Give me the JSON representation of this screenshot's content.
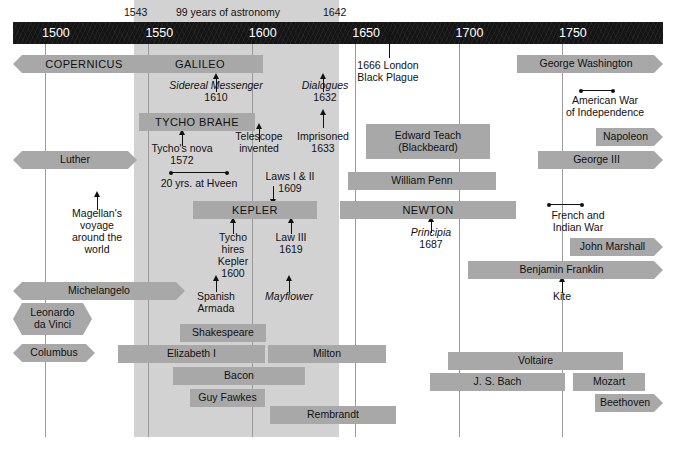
{
  "header": {
    "start_year": "1543",
    "title": "99 years of astronomy",
    "end_year": "1642"
  },
  "axis": {
    "ticks": [
      "1500",
      "1550",
      "1600",
      "1650",
      "1700",
      "1750"
    ],
    "tick_years": [
      1500,
      1550,
      1600,
      1650,
      1700,
      1750
    ],
    "range": [
      1490,
      1805
    ],
    "color": "#141414",
    "label_color": "#ffffff"
  },
  "band": {
    "from_year": 1543,
    "to_year": 1642,
    "color": "#d2d2d2"
  },
  "bar_color": "#a8a8a8",
  "bars": [
    {
      "label": "COPERNICUS",
      "x": 13,
      "y": 55,
      "w": 142,
      "h": 18,
      "style": "tail-lr",
      "caps": true
    },
    {
      "label": "GALILEO",
      "x": 137,
      "y": 55,
      "w": 126,
      "h": 18,
      "style": "plain",
      "caps": true
    },
    {
      "label": "George Washington",
      "x": 517,
      "y": 55,
      "w": 146,
      "h": 18,
      "style": "tail-r",
      "caps": false
    },
    {
      "label": "TYCHO BRAHE",
      "x": 139,
      "y": 113,
      "w": 116,
      "h": 18,
      "style": "plain",
      "caps": true
    },
    {
      "label": "Edward Teach\n(Blackbeard)",
      "x": 366,
      "y": 124,
      "w": 124,
      "h": 35,
      "style": "plain",
      "caps": false
    },
    {
      "label": "Napoleon",
      "x": 596,
      "y": 128,
      "w": 67,
      "h": 18,
      "style": "tail-r",
      "caps": false
    },
    {
      "label": "Luther",
      "x": 13,
      "y": 151,
      "w": 124,
      "h": 18,
      "style": "tail-lr",
      "caps": false
    },
    {
      "label": "George III",
      "x": 538,
      "y": 151,
      "w": 125,
      "h": 18,
      "style": "tail-r",
      "caps": false
    },
    {
      "label": "William Penn",
      "x": 348,
      "y": 172,
      "w": 148,
      "h": 18,
      "style": "plain",
      "caps": false
    },
    {
      "label": "KEPLER",
      "x": 193,
      "y": 201,
      "w": 124,
      "h": 18,
      "style": "plain",
      "caps": true
    },
    {
      "label": "NEWTON",
      "x": 340,
      "y": 201,
      "w": 176,
      "h": 18,
      "style": "plain",
      "caps": true
    },
    {
      "label": "John Marshall",
      "x": 570,
      "y": 238,
      "w": 93,
      "h": 18,
      "style": "tail-r",
      "caps": false
    },
    {
      "label": "Benjamin Franklin",
      "x": 468,
      "y": 261,
      "w": 195,
      "h": 18,
      "style": "tail-r",
      "caps": false
    },
    {
      "label": "Michelangelo",
      "x": 13,
      "y": 282,
      "w": 172,
      "h": 18,
      "style": "tail-lr",
      "caps": false
    },
    {
      "label": "Leonardo\nda Vinci",
      "x": 13,
      "y": 303,
      "w": 79,
      "h": 32,
      "style": "tail-lr",
      "caps": false
    },
    {
      "label": "Shakespeare",
      "x": 180,
      "y": 324,
      "w": 86,
      "h": 18,
      "style": "plain",
      "caps": false
    },
    {
      "label": "Columbus",
      "x": 13,
      "y": 344,
      "w": 82,
      "h": 18,
      "style": "tail-lr",
      "caps": false
    },
    {
      "label": "Elizabeth I",
      "x": 118,
      "y": 345,
      "w": 147,
      "h": 18,
      "style": "plain",
      "caps": false
    },
    {
      "label": "Milton",
      "x": 268,
      "y": 345,
      "w": 118,
      "h": 18,
      "style": "plain",
      "caps": false
    },
    {
      "label": "Voltaire",
      "x": 448,
      "y": 352,
      "w": 175,
      "h": 18,
      "style": "plain",
      "caps": false
    },
    {
      "label": "Bacon",
      "x": 173,
      "y": 367,
      "w": 132,
      "h": 18,
      "style": "plain",
      "caps": false
    },
    {
      "label": "J. S. Bach",
      "x": 430,
      "y": 373,
      "w": 135,
      "h": 18,
      "style": "plain",
      "caps": false
    },
    {
      "label": "Mozart",
      "x": 573,
      "y": 373,
      "w": 72,
      "h": 18,
      "style": "plain",
      "caps": false
    },
    {
      "label": "Guy Fawkes",
      "x": 190,
      "y": 389,
      "w": 75,
      "h": 18,
      "style": "plain",
      "caps": false
    },
    {
      "label": "Beethoven",
      "x": 595,
      "y": 394,
      "w": 68,
      "h": 18,
      "style": "tail-r",
      "caps": false
    },
    {
      "label": "Rembrandt",
      "x": 270,
      "y": 406,
      "w": 126,
      "h": 18,
      "style": "plain",
      "caps": false
    }
  ],
  "annotations": [
    {
      "text": "Sidereal Messenger\n1610",
      "x": 168,
      "y": 80,
      "w": 96,
      "italic_first_line": true
    },
    {
      "text": "Dialogues\n1632",
      "x": 292,
      "y": 80,
      "w": 66,
      "italic_first_line": true
    },
    {
      "text": "1666 London\nBlack Plague",
      "x": 350,
      "y": 60,
      "w": 76,
      "italic_first_line": false
    },
    {
      "text": "American War\nof Independence",
      "x": 550,
      "y": 95,
      "w": 110,
      "italic_first_line": false
    },
    {
      "text": "Telescope\ninvented",
      "x": 229,
      "y": 131,
      "w": 60,
      "italic_first_line": false
    },
    {
      "text": "Imprisoned\n1633",
      "x": 292,
      "y": 131,
      "w": 62,
      "italic_first_line": false
    },
    {
      "text": "Tycho's nova\n1572",
      "x": 146,
      "y": 143,
      "w": 72,
      "italic_first_line": false
    },
    {
      "text": "20 yrs. at Hveen",
      "x": 153,
      "y": 178,
      "w": 92,
      "italic_first_line": false
    },
    {
      "text": "Laws I & II\n1609",
      "x": 256,
      "y": 171,
      "w": 68,
      "italic_first_line": false
    },
    {
      "text": "Principia\n1687",
      "x": 403,
      "y": 227,
      "w": 56,
      "italic_first_line": true
    },
    {
      "text": "French and\nIndian War",
      "x": 540,
      "y": 210,
      "w": 76,
      "italic_first_line": false
    },
    {
      "text": "Magellan's\nvoyage\naround the\nworld",
      "x": 62,
      "y": 208,
      "w": 70,
      "italic_first_line": false
    },
    {
      "text": "Tycho\nhires\nKepler\n1600",
      "x": 208,
      "y": 232,
      "w": 50,
      "italic_first_line": false
    },
    {
      "text": "Law III\n1619",
      "x": 266,
      "y": 232,
      "w": 50,
      "italic_first_line": false
    },
    {
      "text": "Spanish\nArmada",
      "x": 190,
      "y": 291,
      "w": 52,
      "italic_first_line": false
    },
    {
      "text": "Mayflower",
      "x": 258,
      "y": 291,
      "w": 62,
      "italic_first_line": true
    },
    {
      "text": "Kite",
      "x": 545,
      "y": 291,
      "w": 34,
      "italic_first_line": false
    }
  ],
  "arrows": [
    {
      "x": 216,
      "y": 78,
      "h": 14,
      "dir": "up"
    },
    {
      "x": 323,
      "y": 78,
      "h": 14,
      "dir": "up"
    },
    {
      "x": 389,
      "y": 36,
      "h": 22,
      "dir": "up"
    },
    {
      "x": 259,
      "y": 128,
      "h": 14,
      "dir": "up"
    },
    {
      "x": 323,
      "y": 114,
      "h": 14,
      "dir": "up"
    },
    {
      "x": 182,
      "y": 134,
      "h": 12,
      "dir": "up"
    },
    {
      "x": 273,
      "y": 186,
      "h": 14,
      "dir": "down"
    },
    {
      "x": 233,
      "y": 222,
      "h": 12,
      "dir": "up"
    },
    {
      "x": 291,
      "y": 222,
      "h": 12,
      "dir": "up"
    },
    {
      "x": 431,
      "y": 221,
      "h": 12,
      "dir": "up"
    },
    {
      "x": 97,
      "y": 196,
      "h": 14,
      "dir": "up"
    },
    {
      "x": 216,
      "y": 280,
      "h": 12,
      "dir": "up"
    },
    {
      "x": 289,
      "y": 280,
      "h": 12,
      "dir": "up"
    },
    {
      "x": 562,
      "y": 281,
      "h": 12,
      "dir": "up"
    }
  ],
  "spans": [
    {
      "x": 170,
      "y": 172,
      "w": 58,
      "name": "hveen-span"
    },
    {
      "x": 580,
      "y": 90,
      "w": 34,
      "name": "american-war-span"
    },
    {
      "x": 548,
      "y": 204,
      "w": 35,
      "name": "french-indian-war-span"
    }
  ]
}
